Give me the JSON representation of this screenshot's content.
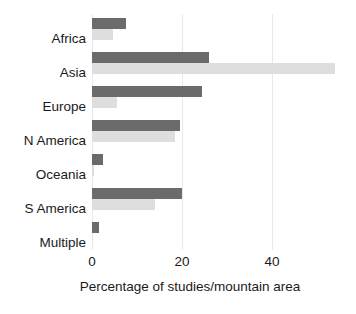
{
  "chart_data": {
    "type": "bar",
    "orientation": "horizontal",
    "title": "",
    "subtitle": "",
    "xlabel": "Percentage of studies/mountain area",
    "ylabel": "",
    "xlim": [
      0,
      56
    ],
    "ylim": null,
    "xticks": [
      0,
      20,
      40
    ],
    "xtick_labels": [
      "0",
      "20",
      "40"
    ],
    "grid": "vertical-only",
    "legend": "none",
    "legend_position": "none",
    "categories": [
      "Africa",
      "Asia",
      "Europe",
      "N America",
      "Oceania",
      "S America",
      "Multiple"
    ],
    "series": [
      {
        "name": "Percentage of studies",
        "color": "#6b6b6b",
        "values": [
          7.5,
          26.0,
          24.5,
          19.5,
          2.5,
          20.0,
          1.5
        ]
      },
      {
        "name": "Percentage of mountain area",
        "color": "#dedede",
        "values": [
          4.7,
          54.0,
          5.5,
          18.5,
          0.5,
          14.0,
          0.0
        ]
      }
    ],
    "colors": {
      "dark_bar": "#6b6b6b",
      "light_bar": "#dedede",
      "gridline": "#e8e8e8",
      "background": "#ffffff",
      "text": "#1a1a1a"
    }
  }
}
